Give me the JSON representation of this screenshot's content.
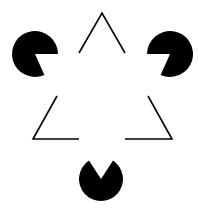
{
  "figure": {
    "title": "Kanizsa triangle",
    "background": "#ffffff",
    "ink": "#000000",
    "pacmen": [
      {
        "name": "top-left",
        "cx": 35,
        "cy": 54,
        "r": 23,
        "d": "M35 54 L44.4 75 A23 23 0 1 1 58 54 Z"
      },
      {
        "name": "top-right",
        "cx": 170,
        "cy": 54,
        "r": 23,
        "d": "M170 54 L147 54 A23 23 0 1 1 160.6 75 Z"
      },
      {
        "name": "bottom",
        "cx": 101,
        "cy": 179,
        "r": 22,
        "d": "M101 179 L113 160.5 A22 22 0 1 1 89 160.5 Z"
      }
    ],
    "outline_corners": [
      {
        "name": "top-apex",
        "points": "79,53 102,13 125,53"
      },
      {
        "name": "bottom-left-corner",
        "points": "57,96 33,139 79,139"
      },
      {
        "name": "bottom-right-corner",
        "points": "148,96 172,139 125,139"
      }
    ]
  }
}
